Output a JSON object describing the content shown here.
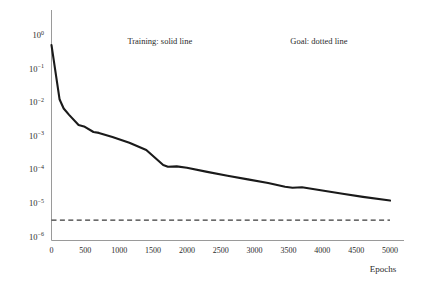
{
  "chart_data": {
    "type": "line",
    "title": "",
    "xlabel": "Epochs",
    "ylabel": "",
    "xlim": [
      0,
      5000
    ],
    "ylim": [
      1e-06,
      1
    ],
    "yscale": "log",
    "grid": false,
    "legend_position": "inside-top",
    "xticks": [
      0,
      500,
      1000,
      1500,
      2000,
      2500,
      3000,
      3500,
      4000,
      4500,
      5000
    ],
    "xticklabels": [
      "0",
      "500",
      "1000",
      "1500",
      "2000",
      "2500",
      "3000",
      "3500",
      "4000",
      "4500",
      "5000"
    ],
    "yticks": [
      1,
      0.1,
      0.01,
      0.001,
      0.0001,
      1e-05,
      1e-06
    ],
    "yticklabels": [
      "10^0",
      "10^-1",
      "10^-2",
      "10^-3",
      "10^-4",
      "10^-5",
      "10^-6"
    ],
    "ytick_mantissa": [
      "10",
      "10",
      "10",
      "10",
      "10",
      "10",
      "10"
    ],
    "ytick_exponents": [
      "0",
      "−1",
      "−2",
      "−3",
      "−4",
      "−5",
      "−6"
    ],
    "annotations": [
      {
        "text": "Training: solid line",
        "x": 1600,
        "y": 0.55
      },
      {
        "text": "Goal: dotted line",
        "x": 3950,
        "y": 0.55
      }
    ],
    "series": [
      {
        "name": "Training",
        "style": "solid",
        "color": "#1a1a1a",
        "x": [
          0,
          120,
          180,
          260,
          400,
          480,
          620,
          700,
          900,
          1150,
          1400,
          1650,
          1720,
          1850,
          2000,
          2300,
          2600,
          2900,
          3200,
          3450,
          3560,
          3700,
          4000,
          4300,
          4600,
          5000
        ],
        "y": [
          0.5,
          0.012,
          0.0065,
          0.0042,
          0.0021,
          0.0019,
          0.0013,
          0.00122,
          0.00092,
          0.00062,
          0.00038,
          0.000135,
          0.00012,
          0.000123,
          0.000112,
          8.45e-05,
          6.45e-05,
          5.05e-05,
          3.95e-05,
          3.05e-05,
          2.85e-05,
          2.95e-05,
          2.35e-05,
          1.88e-05,
          1.52e-05,
          1.18e-05
        ]
      },
      {
        "name": "Goal",
        "style": "dashed",
        "color": "#3a3a3a",
        "x": [
          0,
          5000
        ],
        "y": [
          3.1e-06,
          3.1e-06
        ]
      }
    ]
  },
  "axes": {
    "x_axis_title": "Epochs",
    "y_axis_title": ""
  }
}
